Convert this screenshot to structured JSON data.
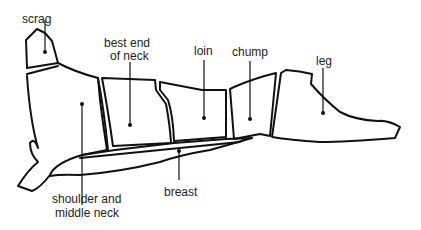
{
  "diagram": {
    "stroke_color": "#111111",
    "background_color": "#ffffff",
    "labels": {
      "scrag": "scrag",
      "best_end_line1": "best end",
      "best_end_line2": "of neck",
      "loin": "loin",
      "chump": "chump",
      "leg": "leg",
      "shoulder_line1": "shoulder and",
      "shoulder_line2": "middle neck",
      "breast": "breast"
    },
    "cuts": [
      "scrag",
      "best end of neck",
      "loin",
      "chump",
      "leg",
      "shoulder and middle neck",
      "breast"
    ]
  }
}
